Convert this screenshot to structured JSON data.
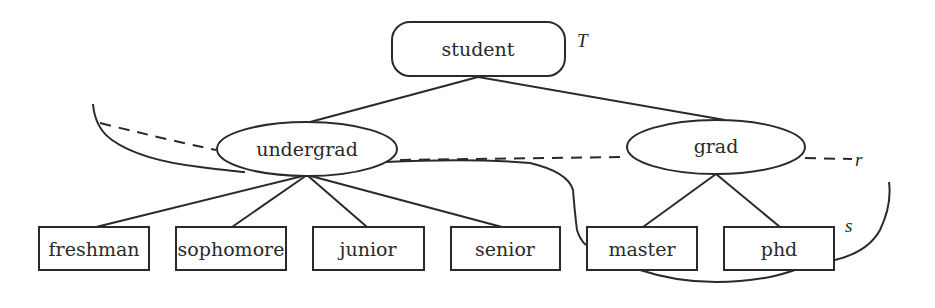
{
  "diagram": {
    "type": "hierarchy-tree",
    "root": {
      "id": "student",
      "label": "student",
      "shape": "rounded-rectangle",
      "tag": "T"
    },
    "level1": [
      {
        "id": "undergrad",
        "label": "undergrad",
        "shape": "ellipse",
        "parent": "student"
      },
      {
        "id": "grad",
        "label": "grad",
        "shape": "ellipse",
        "parent": "student"
      }
    ],
    "leaves": [
      {
        "id": "freshman",
        "label": "freshman",
        "shape": "rectangle",
        "parent": "undergrad"
      },
      {
        "id": "sophomore",
        "label": "sophomore",
        "shape": "rectangle",
        "parent": "undergrad"
      },
      {
        "id": "junior",
        "label": "junior",
        "shape": "rectangle",
        "parent": "undergrad"
      },
      {
        "id": "senior",
        "label": "senior",
        "shape": "rectangle",
        "parent": "undergrad"
      },
      {
        "id": "master",
        "label": "master",
        "shape": "rectangle",
        "parent": "grad"
      },
      {
        "id": "phd",
        "label": "phd",
        "shape": "rectangle",
        "parent": "grad"
      }
    ],
    "regions": [
      {
        "id": "r",
        "label": "r",
        "style": "dashed-and-solid boundary enclosing undergrad and grad"
      },
      {
        "id": "s",
        "label": "s",
        "style": "solid boundary enclosing undergrad, grad, master, phd"
      }
    ],
    "colors": {
      "ink": "#2a2a2a",
      "background": "#ffffff"
    }
  }
}
